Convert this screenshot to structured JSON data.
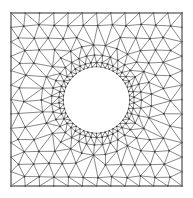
{
  "figure": {
    "canvas": {
      "width": 193,
      "height": 198
    },
    "square": {
      "x0": 11,
      "y0": 13,
      "x1": 182,
      "y1": 186
    },
    "hole": {
      "cx": 96.5,
      "cy": 100,
      "r": 33
    },
    "boundary_divisions": 12,
    "hole_divisions": 48,
    "ring_count": 4,
    "interior_spacing": 14.5,
    "colors": {
      "edge": "#555555",
      "node": "#333333",
      "border": "#777777",
      "background": "#ffffff",
      "hole": "#ffffff"
    }
  }
}
